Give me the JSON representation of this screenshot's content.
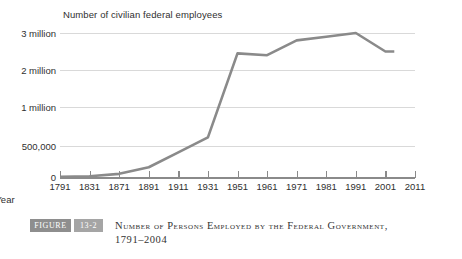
{
  "chart_data": {
    "type": "line",
    "title": "Number of civilian federal employees",
    "xlabel": "Year",
    "ylabel": "",
    "grid": true,
    "legend": "none",
    "note": "Y axis uses a broken / non-linear scale: 0, 500,000, 1 million, 2 million, 3 million are drawn at evenly spaced gridlines.",
    "y_tick_labels": [
      "3 million",
      "2 million",
      "1 million",
      "500,000",
      "0"
    ],
    "y_tick_values": [
      3000000,
      2000000,
      1000000,
      500000,
      0
    ],
    "x_tick_labels": [
      "1791",
      "1831",
      "1871",
      "1891",
      "1911",
      "1931",
      "1951",
      "1961",
      "1971",
      "1981",
      "1991",
      "2001",
      "2011"
    ],
    "x_tick_values": [
      1791,
      1831,
      1871,
      1891,
      1911,
      1931,
      1951,
      1961,
      1971,
      1981,
      1991,
      2001,
      2011
    ],
    "xlim": [
      1791,
      2011
    ],
    "ylim": [
      0,
      3000000
    ],
    "series": [
      {
        "name": "Number of civilian federal employees",
        "color": "#8a8a8a",
        "x": [
          1791,
          1831,
          1871,
          1891,
          1911,
          1931,
          1951,
          1961,
          1971,
          1981,
          1991,
          2001,
          2004
        ],
        "values": [
          5000,
          11500,
          51000,
          157000,
          396000,
          610000,
          2450000,
          2400000,
          2800000,
          2900000,
          3050000,
          2500000,
          2500000
        ]
      }
    ]
  },
  "caption": {
    "figure_badge": "FIGURE",
    "figure_number": "13-2",
    "line_1": "Number of Persons Employed by the Federal Government,",
    "line_2": "1791–2004"
  }
}
